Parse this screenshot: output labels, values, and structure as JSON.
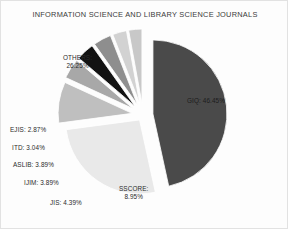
{
  "chart_data": {
    "type": "pie",
    "title": "INFORMATION SCIENCE AND LIBRARY SCIENCE JOURNALS",
    "xlabel": "",
    "ylabel": "",
    "legend": "none",
    "grid": false,
    "exploded": true,
    "value_unit": "percent",
    "categories": [
      "GIQ",
      "OTHERS",
      "SSCORE",
      "JIS",
      "IJIM",
      "ASLIB",
      "ITD",
      "EJIS"
    ],
    "values": [
      46.45,
      26.25,
      8.95,
      4.39,
      3.89,
      3.89,
      3.04,
      2.87
    ],
    "colors": [
      "#4a4a4a",
      "#e9e9e9",
      "#bfbfbf",
      "#a8a8a8",
      "#121212",
      "#8e8e8e",
      "#d2d2d2",
      "#c8c8c8"
    ],
    "slices": [
      {
        "name": "GIQ",
        "value": 46.45,
        "label": "GIQ: 46.45%",
        "color": "#4a4a4a"
      },
      {
        "name": "OTHERS",
        "value": 26.25,
        "label_line1": "OTHERS:",
        "label_line2": "26.25%",
        "color": "#e9e9e9"
      },
      {
        "name": "SSCORE",
        "value": 8.95,
        "label_line1": "SSCORE:",
        "label_line2": "8.95%",
        "color": "#bfbfbf"
      },
      {
        "name": "JIS",
        "value": 4.39,
        "label": "JIS: 4.39%",
        "color": "#a8a8a8"
      },
      {
        "name": "IJIM",
        "value": 3.89,
        "label": "IJIM: 3.89%",
        "color": "#121212"
      },
      {
        "name": "ASLIB",
        "value": 3.89,
        "label": "ASLIB: 3.89%",
        "color": "#8e8e8e"
      },
      {
        "name": "ITD",
        "value": 3.04,
        "label": "ITD: 3.04%",
        "color": "#d2d2d2"
      },
      {
        "name": "EJIS",
        "value": 2.87,
        "label": "EJIS: 2.87%",
        "color": "#c8c8c8"
      }
    ]
  },
  "labels": {
    "giq": "GIQ: 46.45%",
    "others_line1": "OTHERS:",
    "others_line2": "26.25%",
    "sscore_line1": "SSCORE:",
    "sscore_line2": "8.95%",
    "jis": "JIS: 4.39%",
    "ijim": "IJIM: 3.89%",
    "aslib": "ASLIB: 3.89%",
    "itd": "ITD: 3.04%",
    "ejis": "EJIS: 2.87%"
  }
}
